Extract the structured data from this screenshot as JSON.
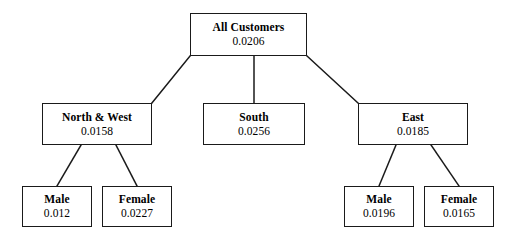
{
  "diagram": {
    "type": "tree",
    "line_color": "#1a1a1a",
    "box_border_color": "#1a1a1a",
    "background_color": "#ffffff"
  },
  "nodes": {
    "root": {
      "label": "All Customers",
      "value": "0.0206"
    },
    "north_west": {
      "label": "North & West",
      "value": "0.0158"
    },
    "south": {
      "label": "South",
      "value": "0.0256"
    },
    "east": {
      "label": "East",
      "value": "0.0185"
    },
    "nw_male": {
      "label": "Male",
      "value": "0.012"
    },
    "nw_female": {
      "label": "Female",
      "value": "0.0227"
    },
    "east_male": {
      "label": "Male",
      "value": "0.0196"
    },
    "east_female": {
      "label": "Female",
      "value": "0.0165"
    }
  },
  "edges": [
    {
      "from": "root",
      "to": "north_west"
    },
    {
      "from": "root",
      "to": "south"
    },
    {
      "from": "root",
      "to": "east"
    },
    {
      "from": "north_west",
      "to": "nw_male"
    },
    {
      "from": "north_west",
      "to": "nw_female"
    },
    {
      "from": "east",
      "to": "east_male"
    },
    {
      "from": "east",
      "to": "east_female"
    }
  ]
}
